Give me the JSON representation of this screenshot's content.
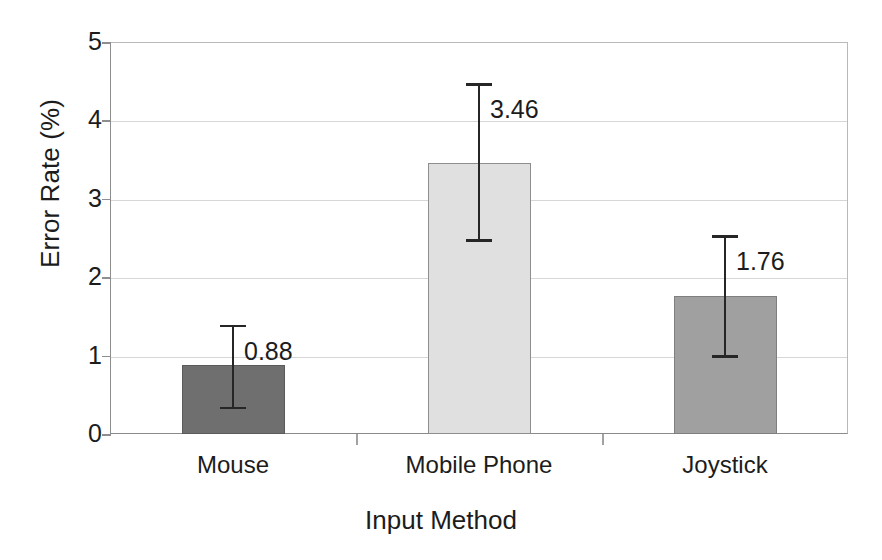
{
  "chart_data": {
    "type": "bar",
    "title": "",
    "xlabel": "Input Method",
    "ylabel": "Error Rate (%)",
    "categories": [
      "Mouse",
      "Mobile Phone",
      "Joystick"
    ],
    "values": [
      0.88,
      3.46,
      1.76
    ],
    "value_labels": [
      "0.88",
      "3.46",
      "1.76"
    ],
    "series": [
      {
        "name": "Error Rate (%)",
        "values": [
          0.88,
          3.46,
          1.76
        ]
      }
    ],
    "error_bars": [
      {
        "category": "Mouse",
        "lower": 0.33,
        "upper": 1.38
      },
      {
        "category": "Mobile Phone",
        "lower": 2.47,
        "upper": 4.46
      },
      {
        "category": "Joystick",
        "lower": 0.99,
        "upper": 2.52
      }
    ],
    "bar_colors": [
      "#6f6f6f",
      "#e0e0e0",
      "#a0a0a0"
    ],
    "bar_border_colors": [
      "#5a5a5a",
      "#8e8e8e",
      "#7f7f7f"
    ],
    "ylim": [
      0,
      5
    ],
    "ytick_labels": [
      "0",
      "1",
      "2",
      "3",
      "4",
      "5"
    ],
    "ytick_values": [
      0,
      1,
      2,
      3,
      4,
      5
    ],
    "grid": "horizontal",
    "legend": "none",
    "error_bar_color": "#262626",
    "gridline_color": "#d6d6d6",
    "axis_color": "#8e8e8e"
  }
}
